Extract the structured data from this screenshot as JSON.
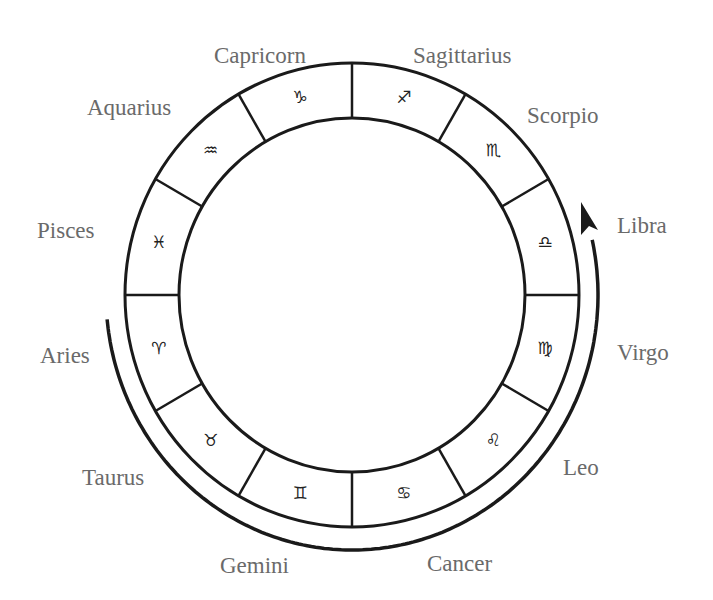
{
  "diagram": {
    "type": "zodiac-wheel",
    "center": [
      352,
      295
    ],
    "outer_radius": [
      227,
      232
    ],
    "inner_radius": [
      173,
      177
    ],
    "glyph_radius": [
      200,
      205
    ],
    "arrow_radius": [
      246,
      255
    ],
    "colors": {
      "line": "#1a1a1a",
      "label": "#6a6a6a",
      "glyph": "#222222",
      "background": "#ffffff"
    },
    "arrow": {
      "direction": "counter-clockwise",
      "start": [
        108,
        318
      ],
      "end_tip": [
        581,
        202
      ]
    }
  },
  "signs": [
    {
      "name": "Aries",
      "glyph": "♈︎",
      "angle": 195,
      "label": {
        "x": 40,
        "y": 363
      }
    },
    {
      "name": "Taurus",
      "glyph": "♉︎",
      "angle": 225,
      "label": {
        "x": 82,
        "y": 485
      }
    },
    {
      "name": "Gemini",
      "glyph": "♊︎",
      "angle": 255,
      "label": {
        "x": 220,
        "y": 573
      }
    },
    {
      "name": "Cancer",
      "glyph": "♋︎",
      "angle": 285,
      "label": {
        "x": 427,
        "y": 571
      }
    },
    {
      "name": "Leo",
      "glyph": "♌︎",
      "angle": 315,
      "label": {
        "x": 563,
        "y": 475
      }
    },
    {
      "name": "Virgo",
      "glyph": "♍︎",
      "angle": 345,
      "label": {
        "x": 617,
        "y": 360
      }
    },
    {
      "name": "Libra",
      "glyph": "♎︎",
      "angle": 15,
      "label": {
        "x": 617,
        "y": 233
      }
    },
    {
      "name": "Scorpio",
      "glyph": "♏︎",
      "angle": 45,
      "label": {
        "x": 527,
        "y": 123
      }
    },
    {
      "name": "Sagittarius",
      "glyph": "♐︎",
      "angle": 75,
      "label": {
        "x": 413,
        "y": 63
      }
    },
    {
      "name": "Capricorn",
      "glyph": "♑︎",
      "angle": 105,
      "label": {
        "x": 214,
        "y": 63
      }
    },
    {
      "name": "Aquarius",
      "glyph": "♒︎",
      "angle": 135,
      "label": {
        "x": 87,
        "y": 115
      }
    },
    {
      "name": "Pisces",
      "glyph": "♓︎",
      "angle": 165,
      "label": {
        "x": 37,
        "y": 238
      }
    }
  ]
}
